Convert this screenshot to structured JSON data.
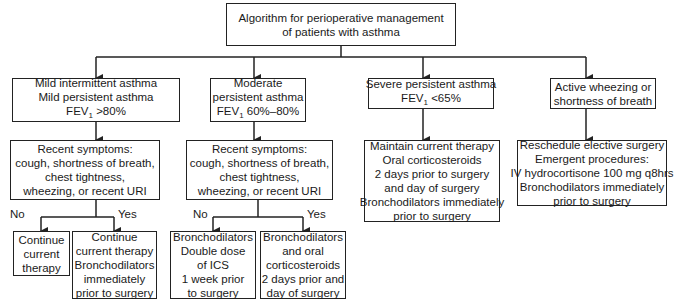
{
  "title": {
    "lines": [
      "Algorithm for perioperative management",
      "of patients with asthma"
    ]
  },
  "categories": [
    {
      "id": "mild",
      "lines": [
        "Mild intermittent asthma",
        "Mild persistent asthma",
        "FEV1 >80%"
      ]
    },
    {
      "id": "moderate",
      "lines": [
        "Moderate",
        "persistent asthma",
        "FEV1 60%–80%"
      ]
    },
    {
      "id": "severe",
      "lines": [
        "Severe persistent asthma",
        "FEV1 <65%"
      ]
    },
    {
      "id": "active",
      "lines": [
        "Active wheezing or",
        "shortness of breath"
      ]
    }
  ],
  "symptoms": {
    "lines": [
      "Recent symptoms:",
      "cough, shortness of breath,",
      "chest tightness,",
      "wheezing, or recent URI"
    ]
  },
  "severe_plan": {
    "lines": [
      "Maintain current therapy",
      "Oral corticosteroids",
      "2 days prior to surgery",
      "and day of surgery",
      "Bronchodilators immediately",
      "prior to surgery"
    ]
  },
  "active_plan": {
    "lines": [
      "Reschedule elective surgery",
      "Emergent procedures:",
      "IV hydrocortisone 100 mg q8hrs",
      "Bronchodilators immediately",
      "prior to surgery"
    ]
  },
  "branch_labels": {
    "no": "No",
    "yes": "Yes"
  },
  "outcomes": {
    "mild_no": {
      "lines": [
        "Continue",
        "current",
        "therapy"
      ]
    },
    "mild_yes": {
      "lines": [
        "Continue",
        "current therapy",
        "Bronchodilators",
        "immediately",
        "prior to surgery"
      ]
    },
    "moderate_no": {
      "lines": [
        "Bronchodilators",
        "Double dose",
        "of ICS",
        "1 week prior",
        "to surgery"
      ]
    },
    "moderate_yes": {
      "lines": [
        "Bronchodilators",
        "and oral",
        "corticosteroids",
        "2 days prior and",
        "day of surgery"
      ]
    }
  }
}
